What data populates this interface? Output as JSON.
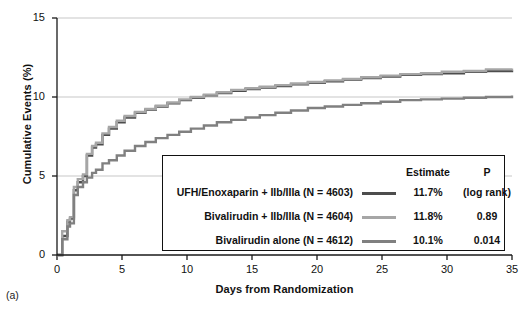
{
  "panel_label": "(a)",
  "axes": {
    "x_title": "Days from Randomization",
    "y_title": "Cumulative Events (%)",
    "x_ticks": [
      "0",
      "5",
      "10",
      "15",
      "20",
      "25",
      "30",
      "35"
    ],
    "y_ticks": [
      "0",
      "5",
      "10",
      "15"
    ]
  },
  "legend": {
    "header": {
      "estimate": "Estimate",
      "p": "P"
    },
    "rows": [
      {
        "label": "UFH/Enoxaparin + IIb/IIIa (N = 4603)",
        "estimate": "11.7%",
        "p": "(log rank)",
        "color": "#4d4d4d",
        "swatch_name": "legend-swatch-ufh-enoxaparin"
      },
      {
        "label": "Bivalirudin + IIb/IIIa (N = 4604)",
        "estimate": "11.8%",
        "p": "0.89",
        "color": "#a6a6a6",
        "swatch_name": "legend-swatch-bivalirudin-gpi"
      },
      {
        "label": "Bivalirudin alone (N = 4612)",
        "estimate": "10.1%",
        "p": "0.014",
        "color": "#808080",
        "swatch_name": "legend-swatch-bivalirudin-alone"
      }
    ]
  },
  "chart_data": {
    "type": "line",
    "title": "",
    "subtitle": "",
    "xlabel": "Days from Randomization",
    "ylabel": "Cumulative Events (%)",
    "xlim": [
      0,
      35
    ],
    "ylim": [
      0,
      15
    ],
    "xticks": [
      0,
      5,
      10,
      15,
      20,
      25,
      30,
      35
    ],
    "yticks": [
      0,
      5,
      10,
      15
    ],
    "grid": "horizontal",
    "legend_position": "inside-bottom-right",
    "step_style": "post",
    "annotations": [
      "(a)"
    ],
    "series": [
      {
        "name": "UFH/Enoxaparin + IIb/IIIa (N = 4603)",
        "estimate": 11.7,
        "p_value": "(log rank)",
        "color": "#4d4d4d",
        "x": [
          0,
          0.4,
          0.8,
          1.0,
          1.3,
          1.6,
          2.0,
          2.3,
          2.7,
          3.0,
          3.5,
          4.0,
          4.6,
          5.2,
          6.0,
          6.8,
          7.6,
          8.5,
          9.4,
          10.3,
          11.3,
          12.3,
          13.4,
          14.5,
          15.6,
          16.8,
          18.0,
          19.3,
          20.6,
          22.0,
          23.4,
          24.9,
          26.4,
          28.0,
          29.6,
          31.3,
          33.0,
          35.0
        ],
        "y": [
          0.0,
          1.2,
          2.1,
          2.3,
          4.1,
          4.6,
          5.0,
          6.3,
          6.8,
          7.0,
          7.6,
          8.0,
          8.4,
          8.7,
          9.0,
          9.2,
          9.4,
          9.6,
          9.8,
          9.95,
          10.1,
          10.25,
          10.4,
          10.5,
          10.6,
          10.7,
          10.8,
          10.9,
          11.0,
          11.1,
          11.2,
          11.3,
          11.4,
          11.45,
          11.5,
          11.6,
          11.65,
          11.7
        ]
      },
      {
        "name": "Bivalirudin + IIb/IIIa (N = 4604)",
        "estimate": 11.8,
        "p_value": "0.89",
        "color": "#a6a6a6",
        "x": [
          0,
          0.4,
          0.8,
          1.0,
          1.3,
          1.6,
          2.0,
          2.3,
          2.7,
          3.0,
          3.5,
          4.0,
          4.6,
          5.2,
          6.0,
          6.8,
          7.6,
          8.5,
          9.4,
          10.3,
          11.3,
          12.3,
          13.4,
          14.5,
          15.6,
          16.8,
          18.0,
          19.3,
          20.6,
          22.0,
          23.4,
          24.9,
          26.4,
          28.0,
          29.6,
          31.3,
          33.0,
          35.0
        ],
        "y": [
          0.0,
          1.5,
          2.2,
          2.4,
          4.3,
          4.8,
          5.1,
          6.4,
          6.9,
          7.1,
          7.7,
          8.1,
          8.5,
          8.8,
          9.05,
          9.25,
          9.45,
          9.65,
          9.85,
          10.0,
          10.15,
          10.3,
          10.45,
          10.55,
          10.65,
          10.75,
          10.85,
          10.95,
          11.05,
          11.15,
          11.25,
          11.35,
          11.45,
          11.5,
          11.6,
          11.65,
          11.75,
          11.8
        ]
      },
      {
        "name": "Bivalirudin alone (N = 4612)",
        "estimate": 10.1,
        "p_value": "0.014",
        "color": "#808080",
        "x": [
          0,
          0.4,
          0.8,
          1.0,
          1.3,
          1.6,
          2.0,
          2.3,
          2.7,
          3.0,
          3.5,
          4.0,
          4.6,
          5.2,
          6.0,
          6.8,
          7.6,
          8.5,
          9.4,
          10.3,
          11.3,
          12.3,
          13.4,
          14.5,
          15.6,
          16.8,
          18.0,
          19.3,
          20.6,
          22.0,
          23.4,
          24.9,
          26.4,
          28.0,
          29.6,
          31.3,
          33.0,
          35.0
        ],
        "y": [
          0.0,
          1.0,
          1.8,
          2.0,
          3.8,
          4.3,
          4.6,
          4.9,
          5.2,
          5.4,
          5.8,
          6.0,
          6.3,
          6.6,
          6.9,
          7.15,
          7.4,
          7.6,
          7.8,
          8.0,
          8.2,
          8.4,
          8.55,
          8.7,
          8.85,
          9.0,
          9.15,
          9.3,
          9.4,
          9.5,
          9.6,
          9.7,
          9.8,
          9.85,
          9.9,
          9.95,
          10.0,
          10.1
        ]
      }
    ]
  }
}
